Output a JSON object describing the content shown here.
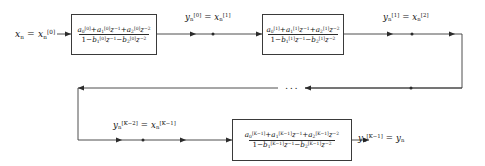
{
  "diagram": {
    "type": "signal-flow-block-diagram",
    "line_color": "#3a3a3a",
    "text_color": "#111111",
    "background": "#ffffff",
    "ellipsis": "..."
  },
  "blocks": [
    {
      "id": "section-0",
      "index": "[0]",
      "numerator": "a₀[0] + a₁[0]z⁻¹ + a₂[0]z⁻²",
      "denominator": "1 − b₁[0]z⁻¹ − b₂[0]z⁻²"
    },
    {
      "id": "section-1",
      "index": "[1]",
      "numerator": "a₀[1] + a₁[1]z⁻¹ + a₂[1]z⁻²",
      "denominator": "1 − b₁[1]z⁻¹ − b₂[1]z⁻²"
    },
    {
      "id": "section-K-1",
      "index": "[K-1]",
      "numerator": "a₀[K-1] + a₁[K-1]z⁻¹ + a₂[K-1]z⁻²",
      "denominator": "1 − b₁[K-1]z⁻¹ − b₂[K-1]z⁻²"
    }
  ],
  "signals": {
    "input": "xₙ = xₙ[0]",
    "after_section_0": "yₙ[0] = xₙ[1]",
    "after_section_1": "yₙ[1] = xₙ[2]",
    "before_last_section": "yₙ[K-2] = xₙ[K-1]",
    "output": "yₙ[K-1] = yₙ"
  }
}
